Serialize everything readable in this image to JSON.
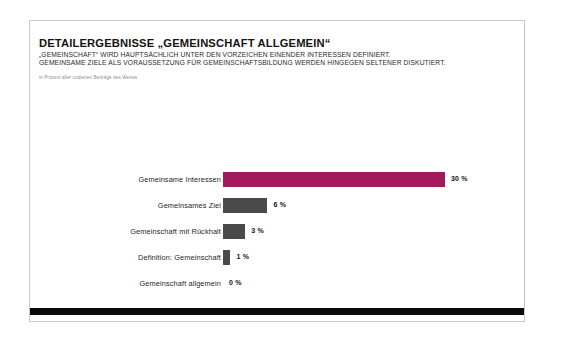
{
  "card": {
    "title": "DETAILERGEBNISSE „GEMEINSCHAFT ALLGEMEIN“",
    "subtitle_line_1": "„GEMEINSCHAFT“ WIRD HAUPTSÄCHLICH UNTER DEN VORZEICHEN EINENDER INTERESSEN DEFINIERT.",
    "subtitle_line_2": "GEMEINSAME ZIELE ALS VORAUSSETZUNG FÜR GEMEINSCHAFTSBILDUNG WERDEN HINGEGEN SELTENER DISKUTIERT.",
    "source_note": "in Prozent aller codierten Beiträge des Wertes"
  },
  "colors": {
    "highlight": "#a5185c",
    "neutral": "#4a4a4a",
    "footer": "#0a0a0a",
    "card_border": "#c9c9c9"
  },
  "chart_data": {
    "type": "bar",
    "orientation": "horizontal",
    "title": "DETAILERGEBNISSE „GEMEINSCHAFT ALLGEMEIN“",
    "subtitle": "„GEMEINSCHAFT“ WIRD HAUPTSÄCHLICH UNTER DEN VORZEICHEN EINENDER INTERESSEN DEFINIERT. GEMEINSAME ZIELE ALS VORAUSSETZUNG FÜR GEMEINSCHAFTSBILDUNG WERDEN HINGEGEN SELTENER DISKUTIERT.",
    "xlabel": "",
    "ylabel": "",
    "unit": "%",
    "xlim": [
      0,
      30
    ],
    "grid": false,
    "legend": false,
    "categories": [
      "Gemeinsame Interessen",
      "Gemeinsames Ziel",
      "Gemeinschaft mit Rückhalt",
      "Definition: Gemeinschaft",
      "Gemeinschaft allgemein"
    ],
    "values": [
      30,
      6,
      3,
      1,
      0
    ],
    "value_labels": [
      "30 %",
      "6 %",
      "3 %",
      "1 %",
      "0 %"
    ],
    "bar_colors": [
      "#a5185c",
      "#4a4a4a",
      "#4a4a4a",
      "#4a4a4a",
      "#4a4a4a"
    ],
    "note": "in Prozent aller codierten Beiträge des Wertes"
  }
}
